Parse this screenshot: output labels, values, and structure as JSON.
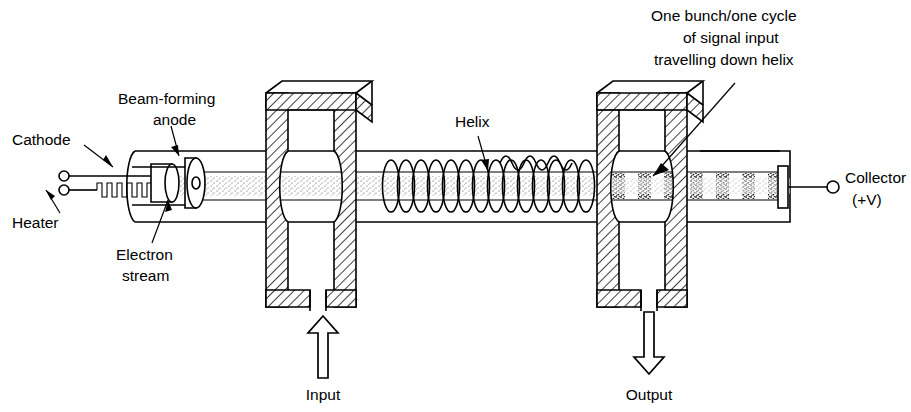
{
  "diagram": {
    "background_color": "#ffffff",
    "line_color": "#000000",
    "labels": {
      "cathode": "Cathode",
      "heater": "Heater",
      "beam_forming_anode_line1": "Beam-forming",
      "beam_forming_anode_line2": "anode",
      "electron_stream_line1": "Electron",
      "electron_stream_line2": "stream",
      "helix": "Helix",
      "bunch_note_line1": "One bunch/one cycle",
      "bunch_note_line2": "of signal input",
      "bunch_note_line3": "travelling down helix",
      "collector_line1": "Collector",
      "collector_line2": "(+V)",
      "input": "Input",
      "output": "Output"
    },
    "components": [
      {
        "name": "heater-filament",
        "label": "Heater"
      },
      {
        "name": "cathode",
        "label": "Cathode"
      },
      {
        "name": "beam-forming-anode",
        "label": "Beam-forming anode"
      },
      {
        "name": "electron-stream",
        "label": "Electron stream"
      },
      {
        "name": "input-cavity",
        "label": "Input"
      },
      {
        "name": "helix",
        "label": "Helix"
      },
      {
        "name": "signal-wave",
        "label": "One bunch/one cycle of signal input travelling down helix"
      },
      {
        "name": "output-cavity",
        "label": "Output"
      },
      {
        "name": "collector",
        "label": "Collector (+V)"
      }
    ],
    "icons": {
      "input_arrow": "up-arrow-icon",
      "output_arrow": "down-arrow-icon",
      "leader_arrow": "leader-arrow-icon",
      "terminal": "terminal-dot-icon"
    }
  }
}
